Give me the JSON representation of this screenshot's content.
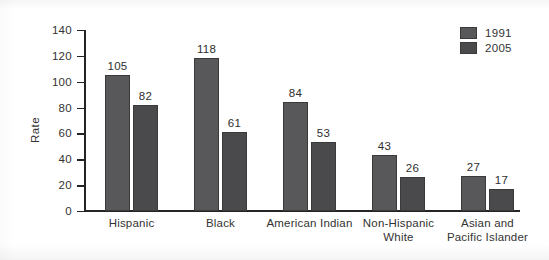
{
  "chart_data": {
    "type": "bar",
    "title": "",
    "xlabel": "",
    "ylabel": "Rate",
    "ylim": [
      0,
      140
    ],
    "yticks": [
      0,
      20,
      40,
      60,
      80,
      100,
      120,
      140
    ],
    "grid": false,
    "legend_position": "top-right",
    "categories": [
      "Hispanic",
      "Black",
      "American Indian",
      "Non-Hispanic\nWhite",
      "Asian and\nPacific Islander"
    ],
    "series": [
      {
        "name": "1991",
        "color": "#58585a",
        "values": [
          105,
          118,
          84,
          43,
          27
        ]
      },
      {
        "name": "2005",
        "color": "#4a4a4c",
        "values": [
          82,
          61,
          53,
          26,
          17
        ]
      }
    ]
  },
  "axis": {
    "y_title": "Rate",
    "tick_labels": [
      "140",
      "120",
      "100",
      "80",
      "60",
      "40",
      "20",
      "0"
    ]
  },
  "legend": {
    "items": [
      {
        "label": "1991",
        "color": "#58585a"
      },
      {
        "label": "2005",
        "color": "#4a4a4c"
      }
    ]
  },
  "colors": {
    "series_1991": "#58585a",
    "series_2005": "#4a4a4c",
    "axis": "#242424",
    "text": "#333333",
    "background": "#ffffff"
  }
}
